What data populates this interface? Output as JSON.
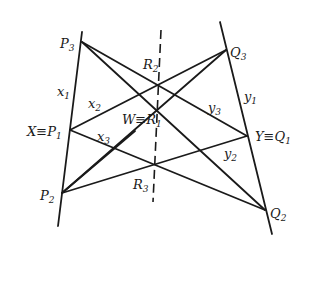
{
  "diagram": {
    "labels": {
      "P3": {
        "main": "P",
        "sub": "3"
      },
      "P1": {
        "prefix": "X≡P",
        "sub": "1"
      },
      "P2": {
        "main": "P",
        "sub": "2"
      },
      "Q3": {
        "main": "Q",
        "sub": "3"
      },
      "Q1": {
        "prefix": "Y≡Q",
        "sub": "1"
      },
      "Q2": {
        "main": "Q",
        "sub": "2"
      },
      "R2": {
        "main": "R",
        "sub": "2"
      },
      "R1": {
        "prefix": "W≡R",
        "sub": "1"
      },
      "R3": {
        "main": "R",
        "sub": "3"
      },
      "x1": {
        "main": "x",
        "sub": "1"
      },
      "x2": {
        "main": "x",
        "sub": "2"
      },
      "x3": {
        "main": "x",
        "sub": "3"
      },
      "y1": {
        "main": "y",
        "sub": "1"
      },
      "y2": {
        "main": "y",
        "sub": "2"
      },
      "y3": {
        "main": "y",
        "sub": "3"
      }
    },
    "colors": {
      "ink": "#1a1a1a",
      "background": "#ffffff"
    }
  }
}
